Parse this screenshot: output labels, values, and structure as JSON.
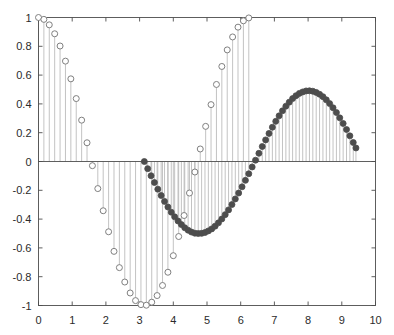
{
  "chart_data": {
    "type": "scatter",
    "title": "",
    "xlabel": "",
    "ylabel": "",
    "xlim": [
      0,
      10
    ],
    "ylim": [
      -1,
      1
    ],
    "grid": false,
    "legend": "none",
    "style": "stem-plot",
    "xticks": [
      0,
      1,
      2,
      3,
      4,
      5,
      6,
      7,
      8,
      9,
      10
    ],
    "xticklabels": [
      "0",
      "1",
      "2",
      "3",
      "4",
      "5",
      "6",
      "7",
      "8",
      "9",
      "10"
    ],
    "yticks": [
      -1,
      -0.8,
      -0.6,
      -0.4,
      -0.2,
      0,
      0.2,
      0.4,
      0.6,
      0.8,
      1
    ],
    "yticklabels": [
      "-1",
      "-0.8",
      "-0.6",
      "-0.4",
      "-0.2",
      "0",
      "0.2",
      "0.4",
      "0.6",
      "0.8",
      "1"
    ],
    "baseline": 0,
    "colors": {
      "stem_line": "#b4b4b4",
      "open_marker_edge": "#808080",
      "open_marker_face": "#ffffff",
      "filled_marker": "#4d4d4d",
      "axis": "#4d4d4d",
      "text": "#2b2b2b"
    },
    "series": [
      {
        "name": "open-circle-series",
        "marker": "open-circle",
        "x": [
          0.0,
          0.16,
          0.32,
          0.48,
          0.64,
          0.8,
          0.96,
          1.12,
          1.28,
          1.44,
          1.6,
          1.76,
          1.92,
          2.08,
          2.24,
          2.4,
          2.56,
          2.72,
          2.88,
          3.04,
          3.2,
          3.36,
          3.52,
          3.68,
          3.84,
          4.0,
          4.16,
          4.32,
          4.48,
          4.64,
          4.8,
          4.96,
          5.12,
          5.28,
          5.44,
          5.6,
          5.76,
          5.92,
          6.08,
          6.24
        ],
        "y": [
          1.0,
          0.987,
          0.949,
          0.887,
          0.802,
          0.697,
          0.574,
          0.437,
          0.287,
          0.13,
          -0.029,
          -0.188,
          -0.342,
          -0.488,
          -0.624,
          -0.737,
          -0.837,
          -0.913,
          -0.966,
          -0.994,
          -0.998,
          -0.977,
          -0.931,
          -0.861,
          -0.769,
          -0.654,
          -0.521,
          -0.375,
          -0.219,
          -0.073,
          0.087,
          0.244,
          0.395,
          0.535,
          0.66,
          0.775,
          0.865,
          0.933,
          0.977,
          0.997
        ]
      },
      {
        "name": "filled-circle-series",
        "marker": "filled-circle",
        "x": [
          3.14,
          3.24,
          3.34,
          3.44,
          3.54,
          3.64,
          3.74,
          3.84,
          3.94,
          4.04,
          4.14,
          4.24,
          4.34,
          4.44,
          4.54,
          4.64,
          4.74,
          4.84,
          4.94,
          5.04,
          5.14,
          5.24,
          5.34,
          5.44,
          5.54,
          5.64,
          5.74,
          5.84,
          5.94,
          6.04,
          6.14,
          6.24,
          6.34,
          6.44,
          6.54,
          6.64,
          6.74,
          6.84,
          6.94,
          7.04,
          7.14,
          7.24,
          7.34,
          7.44,
          7.54,
          7.64,
          7.74,
          7.84,
          7.94,
          8.04,
          8.14,
          8.24,
          8.34,
          8.44,
          8.54,
          8.64,
          8.74,
          8.84,
          8.94,
          9.04,
          9.14,
          9.24,
          9.34,
          9.42
        ],
        "y": [
          0.0,
          -0.05,
          -0.099,
          -0.146,
          -0.192,
          -0.236,
          -0.277,
          -0.316,
          -0.352,
          -0.384,
          -0.413,
          -0.438,
          -0.46,
          -0.477,
          -0.49,
          -0.498,
          -0.5,
          -0.499,
          -0.493,
          -0.482,
          -0.468,
          -0.449,
          -0.426,
          -0.399,
          -0.369,
          -0.336,
          -0.299,
          -0.26,
          -0.219,
          -0.176,
          -0.131,
          -0.085,
          -0.038,
          0.009,
          0.057,
          0.104,
          0.15,
          0.195,
          0.238,
          0.279,
          0.317,
          0.352,
          0.384,
          0.412,
          0.437,
          0.457,
          0.473,
          0.483,
          0.49,
          0.491,
          0.488,
          0.48,
          0.467,
          0.45,
          0.428,
          0.402,
          0.373,
          0.34,
          0.303,
          0.264,
          0.222,
          0.178,
          0.132,
          0.094
        ]
      }
    ]
  }
}
